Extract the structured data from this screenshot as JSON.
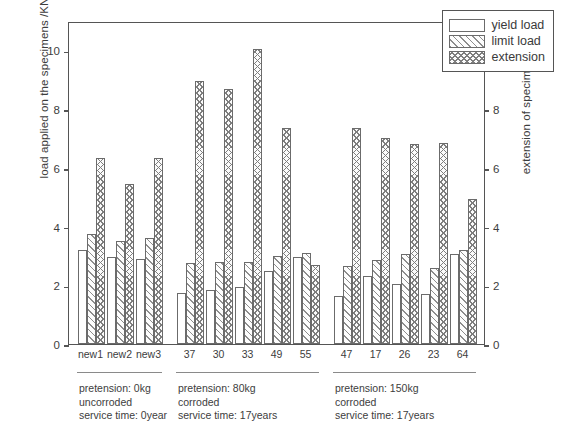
{
  "chart_data": {
    "type": "bar",
    "title": "",
    "ylabel": "load applied on the specimens /KN",
    "ylabel_right": "extension of specimens /mm",
    "xlabel": "",
    "ylim": [
      0,
      11
    ],
    "ylim_right": [
      0,
      11
    ],
    "yticks": [
      0,
      2,
      4,
      6,
      8,
      10
    ],
    "yticks_right": [
      0,
      2,
      4,
      6,
      8,
      10
    ],
    "grid": false,
    "legend_position": "top-right",
    "categories": [
      "new1",
      "new2",
      "new3",
      "37",
      "30",
      "33",
      "49",
      "55",
      "47",
      "17",
      "26",
      "23",
      "64"
    ],
    "series": [
      {
        "name": "yield load",
        "unit": "KN",
        "axis": "left",
        "pattern": "solid-white",
        "values": [
          3.2,
          2.95,
          2.9,
          1.75,
          1.85,
          1.95,
          2.5,
          2.95,
          1.65,
          2.3,
          2.05,
          1.7,
          3.05
        ]
      },
      {
        "name": "limit load",
        "unit": "KN",
        "axis": "left",
        "pattern": "diagonal-hatch",
        "values": [
          3.75,
          3.5,
          3.6,
          2.75,
          2.8,
          2.8,
          3.0,
          3.1,
          2.65,
          2.85,
          3.05,
          2.6,
          3.2
        ]
      },
      {
        "name": "extension",
        "unit": "mm",
        "axis": "right",
        "pattern": "cross-hatch",
        "values": [
          6.35,
          5.45,
          6.35,
          8.95,
          8.7,
          10.05,
          7.35,
          2.7,
          7.35,
          7.0,
          6.8,
          6.85,
          4.95
        ]
      }
    ],
    "groups": [
      {
        "label_span": [
          "new1",
          "new3"
        ],
        "lines": [
          "pretension: 0kg",
          "uncorroded",
          "service time: 0year"
        ]
      },
      {
        "label_span": [
          "37",
          "55"
        ],
        "lines": [
          "pretension: 80kg",
          "corroded",
          "service time: 17years"
        ]
      },
      {
        "label_span": [
          "47",
          "64"
        ],
        "lines": [
          "pretension: 150kg",
          "corroded",
          "service time: 17years"
        ]
      }
    ]
  },
  "legend": {
    "items": [
      {
        "label": "yield load",
        "pattern": "solid-white"
      },
      {
        "label": "limit load",
        "pattern": "diagonal-hatch"
      },
      {
        "label": "extension",
        "pattern": "cross-hatch"
      }
    ]
  }
}
